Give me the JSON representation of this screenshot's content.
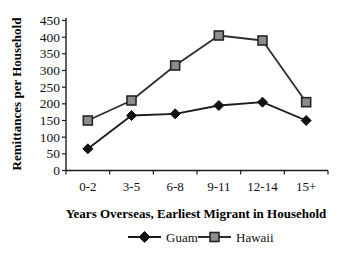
{
  "figure": {
    "background": "#ffffff",
    "text_color": "#111111",
    "axis_color": "#1c1c1c"
  },
  "chart_data": {
    "type": "line",
    "title": "",
    "categories": [
      "0-2",
      "3-5",
      "6-8",
      "9-11",
      "12-14",
      "15+"
    ],
    "series": [
      {
        "name": "Guam",
        "marker": "diamond",
        "line_color": "#1a1a1a",
        "marker_fill": "#121212",
        "marker_stroke": "#121212",
        "values": [
          65,
          165,
          170,
          195,
          205,
          150
        ]
      },
      {
        "name": "Hawaii",
        "marker": "square",
        "line_color": "#2e2e2e",
        "marker_fill": "#8c8c8c",
        "marker_stroke": "#262626",
        "values": [
          150,
          210,
          315,
          405,
          390,
          205
        ]
      }
    ],
    "xlabel": "Years Overseas, Earliest Migrant in Household",
    "ylabel": "Remittances per Household",
    "ylim": [
      0,
      450
    ],
    "ytick_step": 50,
    "yticks": [
      0,
      50,
      100,
      150,
      200,
      250,
      300,
      350,
      400,
      450
    ],
    "grid": false,
    "legend_position": "bottom"
  }
}
